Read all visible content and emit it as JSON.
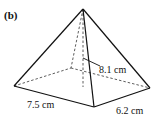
{
  "figure": {
    "label": "(b)",
    "shape": "rectangular-based pyramid",
    "measurements": {
      "slant_height": "8.1 cm",
      "base_length": "7.5 cm",
      "base_width": "6.2 cm"
    },
    "colors": {
      "line": "#111111",
      "background": "#ffffff"
    }
  }
}
